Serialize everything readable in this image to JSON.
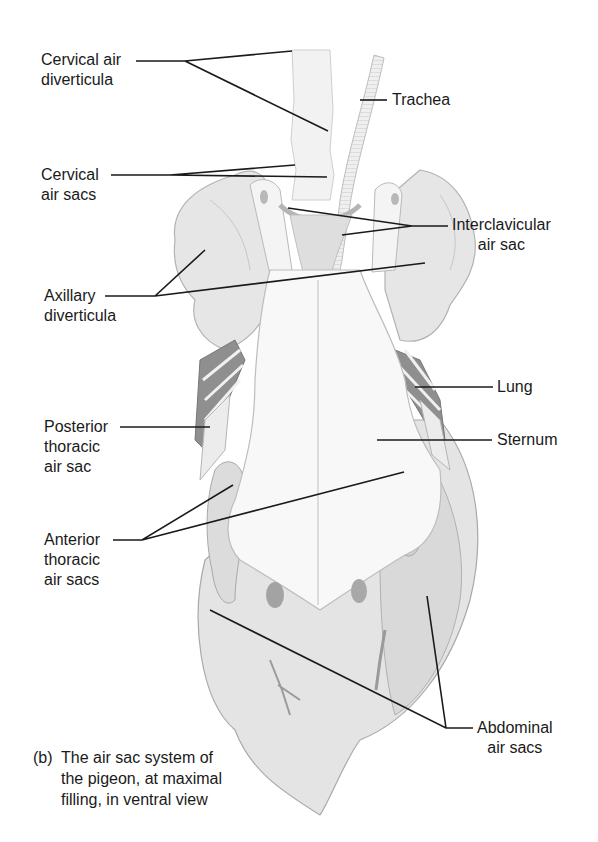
{
  "figure": {
    "panel": "(b)",
    "caption_lines": [
      "The air sac system of",
      "the pigeon, at maximal",
      "filling, in ventral view"
    ],
    "colors": {
      "background": "#ffffff",
      "line": "#1a1a1a",
      "organ_fill": "#e9e9e9",
      "organ_shade": "#c8c8c8",
      "lung_dark": "#8a8a8a",
      "sternum_fill": "#f7f7f7"
    }
  },
  "labels": {
    "cervical_air_diverticula": [
      "Cervical air",
      "diverticula"
    ],
    "trachea": [
      "Trachea"
    ],
    "cervical_air_sacs": [
      "Cervical",
      "air sacs"
    ],
    "interclavicular_air_sac": [
      "Interclavicular",
      "air sac"
    ],
    "axillary_diverticula": [
      "Axillary",
      "diverticula"
    ],
    "lung": [
      "Lung"
    ],
    "posterior_thoracic_air_sac": [
      "Posterior",
      "thoracic",
      "air sac"
    ],
    "sternum": [
      "Sternum"
    ],
    "anterior_thoracic_air_sacs": [
      "Anterior",
      "thoracic",
      "air sacs"
    ],
    "abdominal_air_sacs": [
      "Abdominal",
      "air sacs"
    ]
  }
}
